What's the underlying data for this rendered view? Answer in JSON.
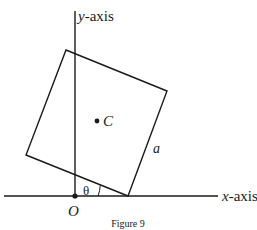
{
  "figure": {
    "caption": "Figure 9",
    "axes": {
      "x_label_var": "x",
      "x_label_rest": "-axis",
      "y_label_var": "y",
      "y_label_rest": "-axis",
      "origin_label": "O"
    },
    "square": {
      "center_label": "C",
      "side_label": "a",
      "angle_label": "θ"
    },
    "colors": {
      "line": "#1a1a1a",
      "background": "#ffffff"
    }
  }
}
